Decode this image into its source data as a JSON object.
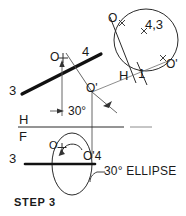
{
  "drawing": {
    "title": "STEP 3",
    "type": "descriptive-geometry-construction",
    "caption": "STEP  3",
    "colors": {
      "ink": "#1a1a1a",
      "thin_line": "#555555",
      "paper": "#ffffff"
    }
  },
  "auxiliary_view": {
    "circle_label_o": "O",
    "circle_label_center": "4,3",
    "circle_label_o_prime": "O'",
    "fold_label_h": "H",
    "fold_label_1": "1"
  },
  "top_view": {
    "label_line_start": "3",
    "label_line_end": "4",
    "label_point_o": "O",
    "label_point_o_prime": "O'",
    "angle_dimension": "30°"
  },
  "fold_line_hf": {
    "upper_label": "H",
    "lower_label": "F"
  },
  "front_view": {
    "label_line_start": "3",
    "label_point_o": "O",
    "label_point_o_prime_4": "O'4",
    "annotation": "30° ELLIPSE"
  }
}
